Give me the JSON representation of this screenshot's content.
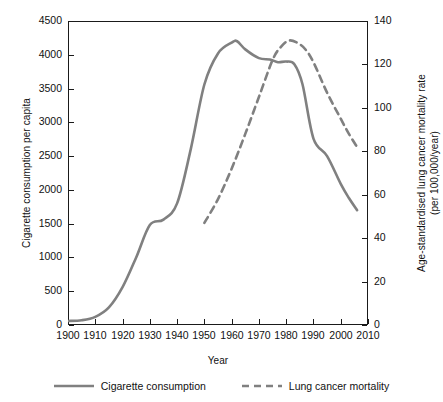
{
  "chart_data": {
    "type": "line",
    "title": "",
    "xlabel": "Year",
    "ylabel": "Cigarette consumption per capita",
    "ylabel_right_line1": "Age-standardised lung cancer mortality rate",
    "ylabel_right_line2": "(per 100,000/year)",
    "xlim": [
      1900,
      2010
    ],
    "ylim": [
      0,
      4500
    ],
    "ylim_right": [
      0,
      140
    ],
    "grid": false,
    "legend_position": "bottom",
    "xticks": [
      1900,
      1910,
      1920,
      1930,
      1940,
      1950,
      1960,
      1970,
      1980,
      1990,
      2000,
      2010
    ],
    "xtick_labels": [
      "1900",
      "1910",
      "1920",
      "1930",
      "1940",
      "1950",
      "1960",
      "1970",
      "1980",
      "1990",
      "2000",
      "2010"
    ],
    "yticks_left": [
      0,
      500,
      1000,
      1500,
      2000,
      2500,
      3000,
      3500,
      4000,
      4500
    ],
    "ytick_labels_left": [
      "0",
      "500",
      "1000",
      "1500",
      "2000",
      "2500",
      "3000",
      "3500",
      "4000",
      "4500"
    ],
    "yticks_right": [
      0,
      20,
      40,
      60,
      80,
      100,
      120,
      140
    ],
    "ytick_labels_right": [
      "0",
      "20",
      "40",
      "60",
      "80",
      "100",
      "120",
      "140"
    ],
    "series": [
      {
        "name": "Cigarette consumption",
        "axis": "left",
        "style": "solid",
        "color": "#808080",
        "x": [
          1900,
          1905,
          1910,
          1915,
          1920,
          1925,
          1930,
          1935,
          1940,
          1945,
          1950,
          1955,
          1960,
          1962,
          1965,
          1970,
          1974,
          1977,
          1980,
          1983,
          1986,
          1990,
          1995,
          2000,
          2003,
          2006
        ],
        "y": [
          60,
          70,
          120,
          260,
          560,
          1000,
          1480,
          1560,
          1800,
          2600,
          3560,
          4020,
          4180,
          4200,
          4080,
          3950,
          3930,
          3890,
          3900,
          3860,
          3560,
          2760,
          2500,
          2090,
          1880,
          1700
        ]
      },
      {
        "name": "Lung cancer mortality",
        "axis": "right",
        "style": "dashed",
        "color": "#808080",
        "x": [
          1950,
          1955,
          1960,
          1965,
          1970,
          1975,
          1978,
          1981,
          1984,
          1987,
          1990,
          1995,
          2000,
          2003,
          2006
        ],
        "y": [
          47,
          58,
          72,
          88,
          105,
          122,
          128,
          131,
          130,
          127,
          121,
          107,
          95,
          88,
          82
        ]
      }
    ]
  },
  "legend": {
    "items": [
      {
        "label": "Cigarette consumption",
        "style": "solid",
        "color": "#808080"
      },
      {
        "label": "Lung cancer mortality",
        "style": "dashed",
        "color": "#808080"
      }
    ]
  },
  "colors": {
    "series": "#808080",
    "axis": "#1a1a1a",
    "background": "#ffffff"
  }
}
